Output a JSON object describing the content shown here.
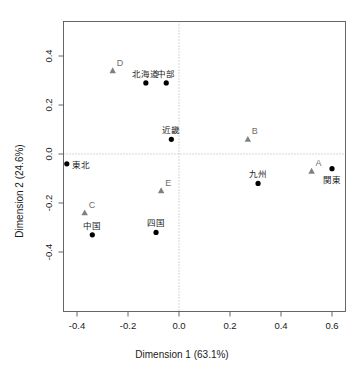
{
  "chart_data": {
    "type": "scatter",
    "title": "",
    "xlabel": "Dimension 1 (63.1%)",
    "ylabel": "Dimension 2 (24.6%)",
    "xlim": [
      -0.47,
      0.64
    ],
    "ylim": [
      -0.53,
      0.52
    ],
    "xticks": [
      -0.4,
      -0.2,
      0.0,
      0.2,
      0.4,
      0.6
    ],
    "xticklabels": [
      "-0.4",
      "-0.2",
      "0.0",
      "0.2",
      "0.4",
      "0.6"
    ],
    "yticks": [
      -0.4,
      -0.2,
      0.0,
      0.2,
      0.4
    ],
    "yticklabels": [
      "-0.4",
      "-0.2",
      "0.0",
      "0.2",
      "0.4"
    ],
    "grid": false,
    "reference_lines": {
      "vertical_x": 0.0,
      "horizontal_y": 0.0,
      "style": "dotted",
      "color": "#9a9a9a"
    },
    "series": [
      {
        "name": "rows",
        "marker": "circle",
        "color": "#000000",
        "label_color": "#1a1a1a",
        "points": [
          {
            "label": "北海道",
            "x": -0.13,
            "y": 0.29,
            "label_pos": "above"
          },
          {
            "label": "中部",
            "x": -0.05,
            "y": 0.29,
            "label_pos": "above"
          },
          {
            "label": "近畿",
            "x": -0.03,
            "y": 0.06,
            "label_pos": "above"
          },
          {
            "label": "東北",
            "x": -0.44,
            "y": -0.04,
            "label_pos": "right"
          },
          {
            "label": "九州",
            "x": 0.31,
            "y": -0.12,
            "label_pos": "above"
          },
          {
            "label": "関東",
            "x": 0.6,
            "y": -0.06,
            "label_pos": "below"
          },
          {
            "label": "中国",
            "x": -0.34,
            "y": -0.33,
            "label_pos": "above"
          },
          {
            "label": "四国",
            "x": -0.09,
            "y": -0.32,
            "label_pos": "above"
          }
        ]
      },
      {
        "name": "columns",
        "marker": "triangle",
        "color": "#808080",
        "label_color": "#6e6e6e",
        "points": [
          {
            "label": "A",
            "x": 0.52,
            "y": -0.07,
            "label_pos": "upper-right"
          },
          {
            "label": "B",
            "x": 0.27,
            "y": 0.06,
            "label_pos": "upper-right"
          },
          {
            "label": "C",
            "x": -0.37,
            "y": -0.24,
            "label_pos": "upper-right"
          },
          {
            "label": "D",
            "x": -0.26,
            "y": 0.34,
            "label_pos": "upper-right"
          },
          {
            "label": "E",
            "x": -0.07,
            "y": -0.15,
            "label_pos": "upper-right"
          }
        ]
      }
    ]
  },
  "axes": {
    "x_title": "Dimension 1 (63.1%)",
    "y_title": "Dimension 2 (24.6%)"
  }
}
